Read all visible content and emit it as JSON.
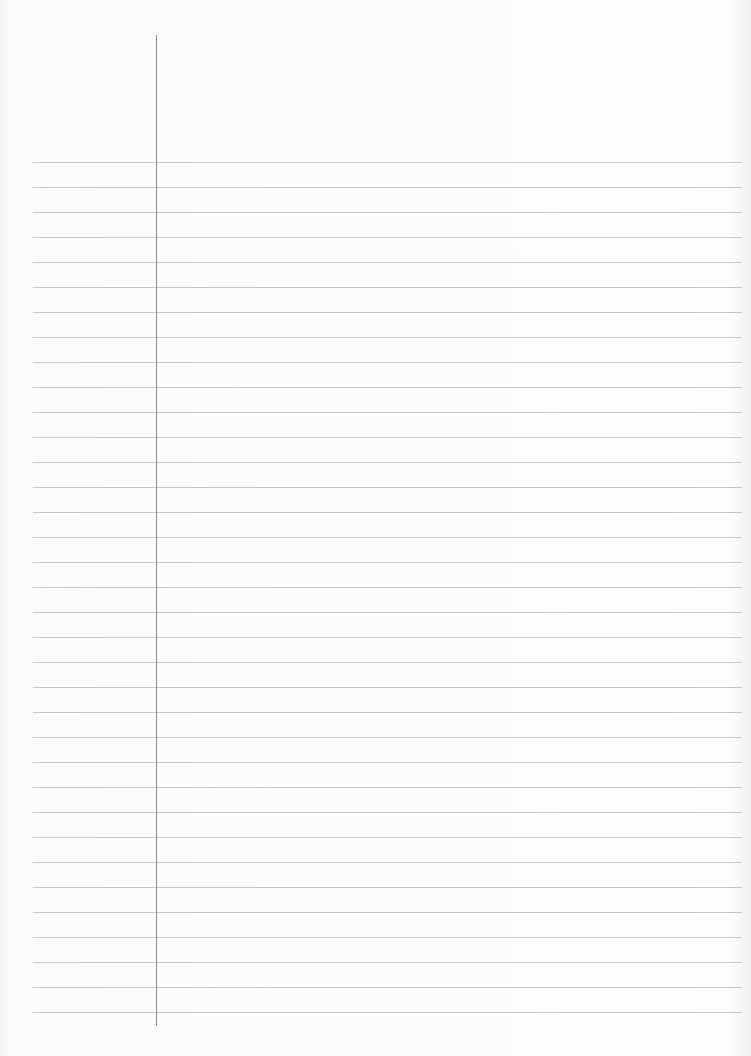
{
  "page": {
    "type": "lined-paper",
    "background_color": "#f9f9f9",
    "rule_color": "#c9c9c9",
    "margin_line_color": "#8a8a8a",
    "rules": {
      "count": 35,
      "first_y": 162,
      "spacing": 25,
      "left_x": 33,
      "right_x": 742
    },
    "margin_line": {
      "x": 156,
      "top_y": 35,
      "bottom_y": 1026
    },
    "text": ""
  }
}
